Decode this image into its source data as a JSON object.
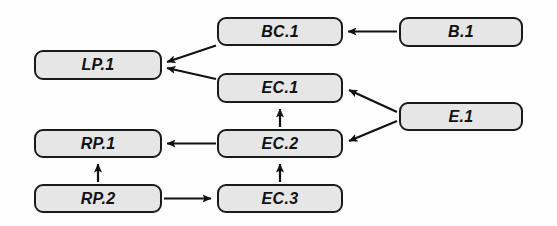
{
  "diagram": {
    "type": "directed-graph",
    "canvas": {
      "width": 557,
      "height": 226,
      "background": "#fefefe"
    },
    "style": {
      "node_fill": "#e6e6e6",
      "node_border": "#1a1a1a",
      "edge_color": "#111111",
      "label_color": "#111111"
    },
    "nodes": [
      {
        "id": "LP.1",
        "label": "LP.1",
        "x": 34,
        "y": 50,
        "w": 128,
        "h": 30
      },
      {
        "id": "BC.1",
        "label": "BC.1",
        "x": 217,
        "y": 17,
        "w": 126,
        "h": 29
      },
      {
        "id": "B.1",
        "label": "B.1",
        "x": 399,
        "y": 17,
        "w": 124,
        "h": 30
      },
      {
        "id": "EC.1",
        "label": "EC.1",
        "x": 217,
        "y": 73,
        "w": 126,
        "h": 30
      },
      {
        "id": "E.1",
        "label": "E.1",
        "x": 399,
        "y": 102,
        "w": 124,
        "h": 29
      },
      {
        "id": "EC.2",
        "label": "EC.2",
        "x": 217,
        "y": 129,
        "w": 126,
        "h": 29
      },
      {
        "id": "RP.1",
        "label": "RP.1",
        "x": 34,
        "y": 129,
        "w": 128,
        "h": 29
      },
      {
        "id": "RP.2",
        "label": "RP.2",
        "x": 34,
        "y": 184,
        "w": 128,
        "h": 29
      },
      {
        "id": "EC.3",
        "label": "EC.3",
        "x": 217,
        "y": 184,
        "w": 126,
        "h": 29
      }
    ],
    "edges": [
      {
        "from": "B.1",
        "to": "BC.1",
        "path": "M 397 31.5 L 348 31.5",
        "name": "edge-b1-to-bc1"
      },
      {
        "from": "BC.1",
        "to": "LP.1",
        "path": "M 216 45.5 L 167 62",
        "name": "edge-bc1-to-lp1"
      },
      {
        "from": "EC.1",
        "to": "LP.1",
        "path": "M 216 79 L 167 68",
        "name": "edge-ec1-to-lp1"
      },
      {
        "from": "E.1",
        "to": "EC.1",
        "path": "M 397 112 L 349 90",
        "name": "edge-e1-to-ec1"
      },
      {
        "from": "E.1",
        "to": "EC.2",
        "path": "M 397 121 L 349 141",
        "name": "edge-e1-to-ec2"
      },
      {
        "from": "EC.2",
        "to": "EC.1",
        "path": "M 280 127 L 280 109",
        "name": "edge-ec2-to-ec1"
      },
      {
        "from": "EC.2",
        "to": "RP.1",
        "path": "M 216 143.5 L 167 143.5",
        "name": "edge-ec2-to-rp1"
      },
      {
        "from": "EC.3",
        "to": "EC.2",
        "path": "M 280 182 L 280 164",
        "name": "edge-ec3-to-ec2"
      },
      {
        "from": "RP.2",
        "to": "RP.1",
        "path": "M 98 182 L 98 164",
        "name": "edge-rp2-to-rp1"
      },
      {
        "from": "RP.2",
        "to": "EC.3",
        "path": "M 164 198.5 L 211 198.5",
        "name": "edge-rp2-to-ec3"
      }
    ]
  }
}
